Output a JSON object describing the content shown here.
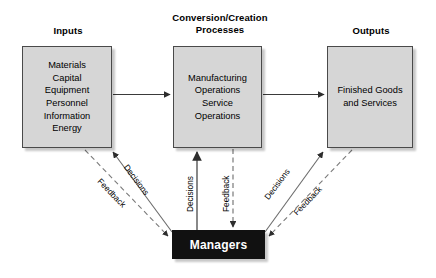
{
  "diagram": {
    "colors": {
      "box_fill": "#d6d6d6",
      "box_border": "#4a4a4a",
      "managers_fill": "#111111",
      "managers_text": "#ffffff",
      "line": "#3a3a3a",
      "background": "#ffffff"
    },
    "headings": {
      "inputs": "Inputs",
      "conversion": "Conversion/Creation\nProcesses",
      "conversion_line1": "Conversion/Creation",
      "conversion_line2": "Processes",
      "outputs": "Outputs"
    },
    "boxes": {
      "inputs": {
        "label": "Inputs",
        "items": [
          "Materials",
          "Capital",
          "Equipment",
          "Personnel",
          "Information",
          "Energy"
        ],
        "text": "Materials\nCapital\nEquipment\nPersonnel\nInformation\nEnergy"
      },
      "conversion": {
        "label": "Conversion/Creation Processes",
        "items": [
          "Manufacturing",
          "Operations",
          "Service",
          "Operations"
        ],
        "text": "Manufacturing\nOperations\nService\nOperations"
      },
      "outputs": {
        "label": "Outputs",
        "items": [
          "Finished Goods",
          "and Services"
        ],
        "text": "Finished Goods\nand Services"
      },
      "managers": {
        "label": "Managers",
        "text": "Managers"
      }
    },
    "edges": [
      {
        "id": "flow-inputs-conversion",
        "label": "",
        "style": "solid",
        "from": "inputs",
        "to": "conversion"
      },
      {
        "id": "flow-conversion-outputs",
        "label": "",
        "style": "solid",
        "from": "conversion",
        "to": "outputs"
      },
      {
        "id": "decisions-left",
        "label": "Decisions",
        "style": "solid",
        "from": "managers",
        "to": "inputs"
      },
      {
        "id": "feedback-left",
        "label": "Feedback",
        "style": "dashed",
        "from": "inputs",
        "to": "managers"
      },
      {
        "id": "decisions-center",
        "label": "Decisions",
        "style": "solid",
        "from": "managers",
        "to": "conversion"
      },
      {
        "id": "feedback-center",
        "label": "Feedback",
        "style": "dashed",
        "from": "conversion",
        "to": "managers"
      },
      {
        "id": "decisions-right",
        "label": "Decisions",
        "style": "solid",
        "from": "managers",
        "to": "outputs"
      },
      {
        "id": "feedback-right",
        "label": "Feedback",
        "style": "dashed",
        "from": "outputs",
        "to": "managers"
      }
    ],
    "edge_labels": {
      "decisions_left": "Decisions",
      "feedback_left": "Feedback",
      "decisions_center": "Decisions",
      "feedback_center": "Feedback",
      "decisions_right": "Decisions",
      "feedback_right": "Feedback"
    }
  }
}
